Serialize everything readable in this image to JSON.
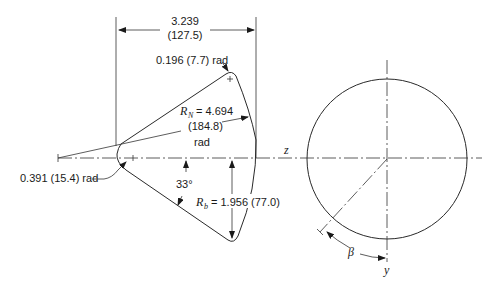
{
  "diagram": {
    "type": "engineering-drawing",
    "dimensions": {
      "chord_length": {
        "value": "3.239",
        "metric": "(127.5)"
      },
      "tip_radius": "0.196 (7.7) rad",
      "nose_radius_label": {
        "symbol": "R",
        "subscript": "N",
        "equals": "= 4.694",
        "metric": "(184.8)",
        "unit": "rad"
      },
      "leading_edge_radius": "0.391 (15.4) rad",
      "angle": "33°",
      "base_radius_label": {
        "symbol": "R",
        "subscript": "b",
        "equals": "= 1.956 (77.0)"
      }
    },
    "axes": {
      "z": "z",
      "y": "y",
      "beta": "β"
    }
  }
}
